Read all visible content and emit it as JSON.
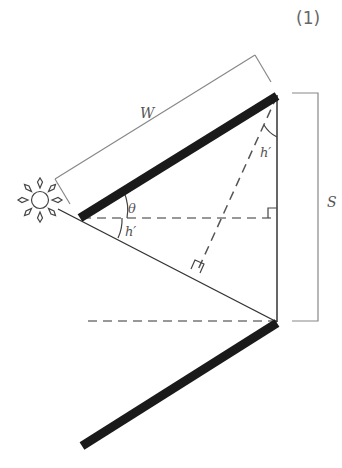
{
  "figure": {
    "number_label": "(1)",
    "labels": {
      "width": "W",
      "spacing": "S",
      "tilt_angle": "θ",
      "sun_height_angle_lower": "h′",
      "sun_height_angle_upper": "h′"
    },
    "elements": {
      "sun": "sun-icon",
      "panels": [
        "upper-solar-panel",
        "lower-solar-panel"
      ],
      "right_angle_markers": 2
    },
    "colors": {
      "panel": "#1a1a1a",
      "line": "#333333",
      "dashed": "#777777",
      "bracket": "#888888",
      "label": "#555555"
    }
  }
}
